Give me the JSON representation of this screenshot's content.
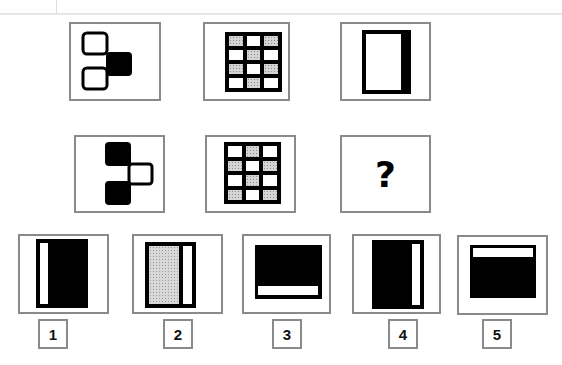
{
  "puzzle": {
    "question_mark": "?",
    "row1": [
      {
        "id": "r1c1",
        "figure": "two-outline-squares-left-filled-square-right"
      },
      {
        "id": "r1c2",
        "figure": "3x4-grid-alternating-shaded-cells-pattern-a"
      },
      {
        "id": "r1c3",
        "figure": "outlined-rectangle-thick-right-border"
      }
    ],
    "row2": [
      {
        "id": "r2c1",
        "figure": "two-filled-squares-left-outline-square-right"
      },
      {
        "id": "r2c2",
        "figure": "3x4-grid-alternating-shaded-cells-pattern-b"
      },
      {
        "id": "r2c3",
        "figure": "question-mark"
      }
    ],
    "grid_pattern_a": [
      [
        1,
        0,
        1
      ],
      [
        0,
        1,
        0
      ],
      [
        1,
        0,
        1
      ],
      [
        0,
        1,
        0
      ]
    ],
    "grid_pattern_b": [
      [
        0,
        1,
        0
      ],
      [
        1,
        0,
        1
      ],
      [
        0,
        1,
        0
      ],
      [
        1,
        0,
        1
      ]
    ]
  },
  "options": [
    {
      "label": "1",
      "figure": "black-rectangle-white-bar-left"
    },
    {
      "label": "2",
      "figure": "dotted-rectangle-black-frame-white-bar-right"
    },
    {
      "label": "3",
      "figure": "black-rectangle-white-bar-bottom"
    },
    {
      "label": "4",
      "figure": "black-rectangle-white-bar-right"
    },
    {
      "label": "5",
      "figure": "black-rectangle-white-bar-top"
    }
  ],
  "colors": {
    "frame": "#8a8a8a",
    "fill": "#000000",
    "shade": "#d4d4d4"
  }
}
